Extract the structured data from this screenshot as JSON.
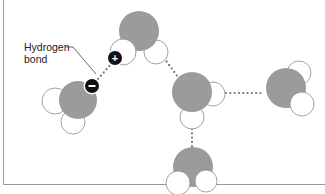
{
  "diagram": {
    "label": {
      "line1": "Hydrogen",
      "line2": "bond"
    },
    "charges": {
      "positive": "+",
      "negative": "−"
    },
    "colors": {
      "oxygen": "#9b9b9b",
      "hydrogen": "#ffffff",
      "outline": "#8c8c8c",
      "bond_dots": "#7a7a7a",
      "charge_badge": "#111111",
      "frame": "#9a9a9a"
    },
    "molecules": [
      {
        "name": "water-molecule-left",
        "oxygen": [
          77,
          100,
          19
        ],
        "hydrogens": [
          [
            55,
            101,
            13
          ],
          [
            73,
            123,
            12
          ]
        ]
      },
      {
        "name": "water-molecule-top",
        "oxygen": [
          139,
          31,
          20
        ],
        "hydrogens": [
          [
            122,
            53,
            13
          ],
          [
            156,
            53,
            12
          ]
        ]
      },
      {
        "name": "water-molecule-center",
        "oxygen": [
          192,
          92,
          20
        ],
        "hydrogens": [
          [
            213,
            94,
            12
          ],
          [
            192,
            116,
            12
          ]
        ]
      },
      {
        "name": "water-molecule-right",
        "oxygen": [
          286,
          87,
          20
        ],
        "hydrogens": [
          [
            300,
            72,
            12
          ],
          [
            302,
            104,
            12
          ]
        ]
      },
      {
        "name": "water-molecule-bottom",
        "oxygen": [
          193,
          167,
          20
        ],
        "hydrogens": [
          [
            178,
            183,
            12
          ],
          [
            206,
            181,
            11
          ]
        ]
      }
    ],
    "hydrogen_bonds": [
      [
        98,
        79,
        112,
        63
      ],
      [
        164,
        58,
        177,
        76
      ],
      [
        227,
        93,
        263,
        93
      ],
      [
        192,
        129,
        192,
        147
      ]
    ]
  }
}
